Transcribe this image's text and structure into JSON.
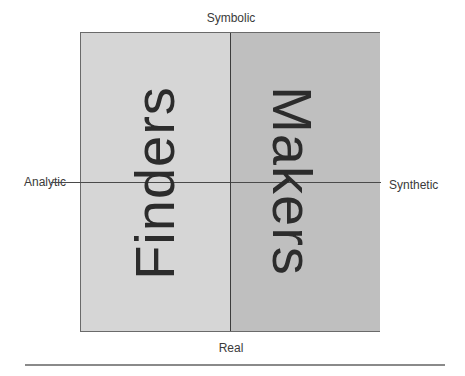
{
  "diagram": {
    "type": "2x2 quadrant",
    "axes": {
      "top": "Symbolic",
      "bottom": "Real",
      "left": "Analytic",
      "right": "Synthetic"
    },
    "regions": [
      {
        "label": "Finders",
        "side": "left",
        "fill": "#d6d6d6",
        "text_orientation": "rotated -90 (reads bottom to top)"
      },
      {
        "label": "Makers",
        "side": "right",
        "fill": "#bfbfbf",
        "text_orientation": "rotated 90 (reads top to bottom)"
      }
    ]
  },
  "colors": {
    "left_fill": "#d6d6d6",
    "right_fill": "#bfbfbf",
    "lines": "#3c3c3c"
  }
}
